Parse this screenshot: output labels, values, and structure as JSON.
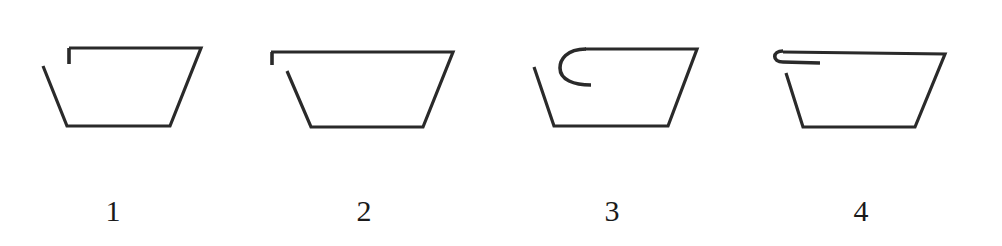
{
  "figure": {
    "stroke_color": "#2a2a2a",
    "items": [
      {
        "label": "1",
        "label_x": 113,
        "body_path": "M 43 66 L 67 126 L 170 126 L 201 48 L 69 48",
        "hook_path": "M 69 48 L 69 64"
      },
      {
        "label": "2",
        "label_x": 364,
        "body_path": "M 287 71 L 311 127 L 423 127 L 453 52 L 271 52",
        "hook_path": "M 272 52 L 272 65"
      },
      {
        "label": "3",
        "label_x": 612,
        "body_path": "M 534 67 L 554 126 L 668 126 L 697 49 L 585 49",
        "hook_path": "M 586 49 C 566 49, 560 60, 560 68 C 560 80, 574 85, 591 85"
      },
      {
        "label": "4",
        "label_x": 861,
        "body_path": "M 786 73 L 803 127 L 915 127 L 945 54 L 783 52",
        "hook_path": "M 783 51 C 772 51, 772 62, 783 62 L 820 63"
      }
    ]
  }
}
